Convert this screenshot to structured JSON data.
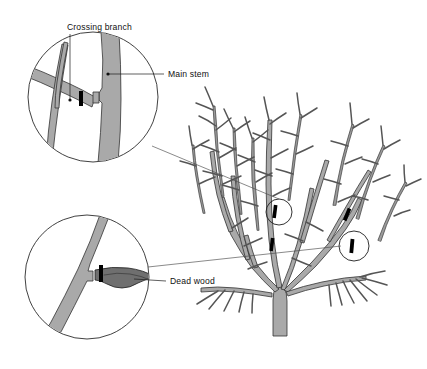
{
  "figure": {
    "background_color": "#ffffff",
    "line_color": "#333333",
    "stem_fill_color": "#a9a9a9",
    "dead_wood_fill_color": "#6f6f6f",
    "cut_mark_color": "#000000"
  },
  "labels": [
    {
      "id": "crossing-branch",
      "text": "Crossing branch",
      "x": 67,
      "y": 28,
      "leader": "vertical down into upper inset"
    },
    {
      "id": "main-stem",
      "text": "Main stem",
      "x": 168,
      "y": 74,
      "leader": "horizontal left into upper inset, dot terminus"
    },
    {
      "id": "dead-wood",
      "text": "Dead wood",
      "x": 170,
      "y": 281,
      "leader": "horizontal left into lower inset, and long line right to shrub"
    }
  ],
  "insets": [
    {
      "id": "upper-inset",
      "name": "crossing-branch-detail",
      "center_x": 93,
      "center_y": 97,
      "radius": 65,
      "shows": "Crossing branch rubbing against the main stem, removed with a pruning cut"
    },
    {
      "id": "lower-inset",
      "name": "dead-wood-detail",
      "center_x": 87,
      "center_y": 277,
      "radius": 62,
      "shows": "Dead wood stub cut back to a healthy main stem"
    }
  ],
  "shrub": {
    "name": "deciduous-shrub",
    "trunk_base_x": 280,
    "trunk_base_y": 336,
    "canopy_top_y": 98,
    "cut_marks": [
      {
        "id": "cut-1",
        "x": 275,
        "y": 212,
        "circled": true
      },
      {
        "id": "cut-2",
        "x": 272,
        "y": 245,
        "circled": false
      },
      {
        "id": "cut-3",
        "x": 347,
        "y": 215,
        "circled": false
      },
      {
        "id": "cut-4",
        "x": 352,
        "y": 246,
        "circled": true
      }
    ],
    "highlight_circles": [
      {
        "id": "shrub-circle-upper",
        "cx": 279,
        "cy": 212,
        "r": 13
      },
      {
        "id": "shrub-circle-lower",
        "cx": 354,
        "cy": 246,
        "r": 15
      }
    ]
  }
}
